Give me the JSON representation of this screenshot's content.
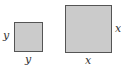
{
  "diagram": {
    "shapes": [
      {
        "id": "small-square",
        "type": "square",
        "side_label": "y",
        "labels": {
          "left": "y",
          "bottom": "y"
        }
      },
      {
        "id": "large-square",
        "type": "square",
        "side_label": "x",
        "labels": {
          "right": "x",
          "bottom": "x"
        }
      }
    ],
    "colors": {
      "fill": "#cbcbcb",
      "stroke": "#555555",
      "label": "#333333",
      "background": "#ffffff"
    }
  }
}
